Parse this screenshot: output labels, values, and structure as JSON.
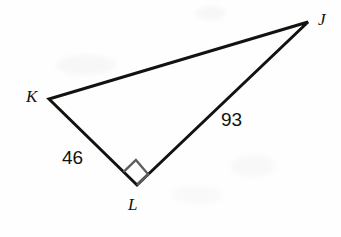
{
  "figure": {
    "kind": "right-triangle-diagram",
    "background_color": "#fefefe",
    "stroke_color": "#14120f",
    "stroke_width": 3,
    "right_angle_color": "#5d5d5d",
    "vertices": [
      {
        "name": "J",
        "label": "J",
        "x": 308,
        "y": 22,
        "label_x": 318,
        "label_y": 11
      },
      {
        "name": "K",
        "label": "K",
        "x": 49,
        "y": 99,
        "label_x": 26,
        "label_y": 88
      },
      {
        "name": "L",
        "label": "L",
        "x": 137,
        "y": 185,
        "label_x": 128,
        "label_y": 196
      }
    ],
    "edges": [
      {
        "name": "edge-KJ",
        "from": "K",
        "to": "J",
        "label": null
      },
      {
        "name": "edge-KL",
        "from": "K",
        "to": "L",
        "label": "46"
      },
      {
        "name": "edge-LJ",
        "from": "L",
        "to": "J",
        "label": "93"
      }
    ],
    "side_labels": [
      {
        "name": "side-label-KL",
        "text": "46",
        "x": 62,
        "y": 148,
        "edge": "edge-KL"
      },
      {
        "name": "side-label-LJ",
        "text": "93",
        "x": 221,
        "y": 110,
        "edge": "edge-LJ"
      }
    ],
    "right_angle": {
      "at_vertex": "L",
      "marker": "square",
      "size": 17,
      "color": "#5d5d5d"
    }
  }
}
